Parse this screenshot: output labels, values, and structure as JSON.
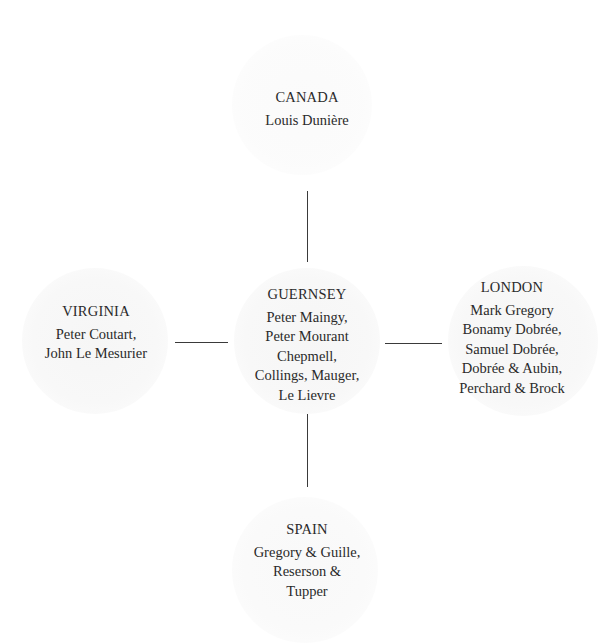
{
  "diagram": {
    "type": "hub-and-spoke",
    "center": {
      "place": "GUERNSEY",
      "lines": [
        "Peter Maingy,",
        "Peter Mourant",
        "Chepmell,",
        "Collings, Mauger,",
        "Le Lievre"
      ]
    },
    "nodes": {
      "north": {
        "place": "CANADA",
        "lines": [
          "Louis Dunière"
        ]
      },
      "west": {
        "place": "VIRGINIA",
        "lines": [
          "Peter Coutart,",
          "John Le Mesurier"
        ]
      },
      "east": {
        "place": "LONDON",
        "lines": [
          "Mark Gregory",
          "Bonamy Dobrée,",
          "Samuel Dobrée,",
          "Dobrée & Aubin,",
          "Perchard & Brock"
        ]
      },
      "south": {
        "place": "SPAIN",
        "lines": [
          "Gregory & Guille,",
          "Reserson &",
          "Tupper"
        ]
      }
    },
    "edges": [
      {
        "from": "GUERNSEY",
        "to": "CANADA"
      },
      {
        "from": "GUERNSEY",
        "to": "VIRGINIA"
      },
      {
        "from": "GUERNSEY",
        "to": "LONDON"
      },
      {
        "from": "GUERNSEY",
        "to": "SPAIN"
      }
    ],
    "colors": {
      "text": "#2a2a2a",
      "line": "#3a3a3a",
      "halo": "#f6f6f6",
      "background": "#ffffff"
    }
  }
}
